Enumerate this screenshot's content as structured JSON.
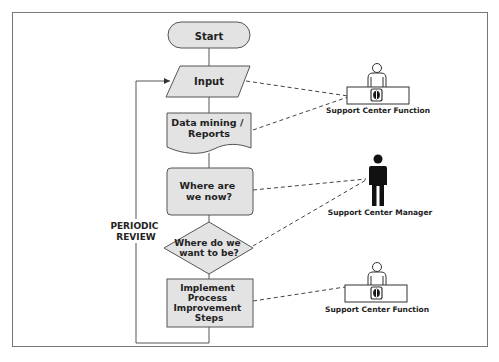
{
  "diagram": {
    "type": "flowchart",
    "nodes": [
      {
        "id": "start",
        "shape": "terminator",
        "label_lines": [
          "Start"
        ]
      },
      {
        "id": "input",
        "shape": "parallelogram",
        "label_lines": [
          "Input"
        ]
      },
      {
        "id": "data_mining",
        "shape": "document",
        "label_lines": [
          "Data mining /",
          "Reports"
        ]
      },
      {
        "id": "where_now",
        "shape": "rounded-rect",
        "label_lines": [
          "Where are",
          "we now?"
        ]
      },
      {
        "id": "where_want",
        "shape": "diamond",
        "label_lines": [
          "Where do we",
          "want to be?"
        ]
      },
      {
        "id": "implement",
        "shape": "rect",
        "label_lines": [
          "Implement",
          "Process",
          "Improvement",
          "Steps"
        ]
      }
    ],
    "loop_label_lines": [
      "PERIODIC",
      "REVIEW"
    ],
    "actors": [
      {
        "id": "scf_top",
        "kind": "person-at-desk",
        "label": "Support Center Function",
        "links": [
          "input",
          "data_mining"
        ]
      },
      {
        "id": "scm",
        "kind": "standing-person",
        "label": "Support Center Manager",
        "links": [
          "where_now",
          "where_want"
        ]
      },
      {
        "id": "scf_bottom",
        "kind": "person-at-desk",
        "label": "Support Center Function",
        "links": [
          "implement"
        ]
      }
    ],
    "colors": {
      "shape_fill": "#e3e3e3",
      "shape_stroke": "#555555",
      "frame_stroke": "#777777",
      "text": "#222222"
    }
  }
}
